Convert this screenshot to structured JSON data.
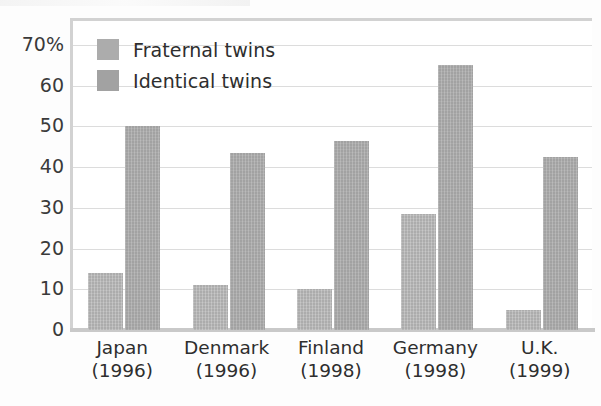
{
  "chart_data": {
    "type": "bar",
    "title": "",
    "subtitle": "",
    "xlabel": "",
    "ylabel": "",
    "ylim": [
      0,
      70
    ],
    "ytick_values": [
      70,
      60,
      50,
      40,
      30,
      20,
      10,
      0
    ],
    "ytick_labels": [
      "70%",
      "60",
      "50",
      "40",
      "30",
      "20",
      "10",
      "0"
    ],
    "grid": true,
    "legend_position": "top-left-inside",
    "categories": [
      "Japan",
      "Denmark",
      "Finland",
      "Germany",
      "U.K."
    ],
    "category_sublabels": [
      "(1996)",
      "(1996)",
      "(1998)",
      "(1998)",
      "(1999)"
    ],
    "category_labels": [
      "Japan\n(1996)",
      "Denmark\n(1996)",
      "Finland\n(1998)",
      "Germany\n(1998)",
      "U.K.\n(1999)"
    ],
    "series": [
      {
        "name": "Fraternal twins",
        "color": "#acacac",
        "values": [
          14,
          11,
          10,
          28.5,
          5
        ]
      },
      {
        "name": "Identical twins",
        "color": "#a2a2a2",
        "values": [
          50,
          43.5,
          46.5,
          65,
          42.5
        ]
      }
    ]
  },
  "legend": {
    "items": [
      {
        "label": "Fraternal twins",
        "color": "#acacac"
      },
      {
        "label": "Identical twins",
        "color": "#a2a2a2"
      }
    ]
  },
  "axis": {
    "y_labels": [
      "70%",
      "60",
      "50",
      "40",
      "30",
      "20",
      "10",
      "0"
    ],
    "x_labels": [
      {
        "name": "Japan",
        "year": "(1996)"
      },
      {
        "name": "Denmark",
        "year": "(1996)"
      },
      {
        "name": "Finland",
        "year": "(1998)"
      },
      {
        "name": "Germany",
        "year": "(1998)"
      },
      {
        "name": "U.K.",
        "year": "(1999)"
      }
    ]
  },
  "colors": {
    "fraternal": "#acacac",
    "identical": "#a2a2a2",
    "gridline": "#dcdcdc",
    "frame": "#d2d2d2",
    "text": "#2e2e2e",
    "background": "#ffffff"
  }
}
